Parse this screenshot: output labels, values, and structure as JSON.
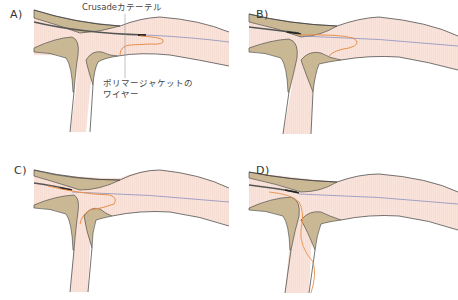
{
  "figure": {
    "panels": [
      {
        "id": "A",
        "label": "A)"
      },
      {
        "id": "B",
        "label": "B)"
      },
      {
        "id": "C",
        "label": "C)"
      },
      {
        "id": "D",
        "label": "D)"
      }
    ],
    "annotations": {
      "catheter": "Crusadeカテーテル",
      "wire_line1": "ポリマージャケットの",
      "wire_line2": "ワイヤー"
    },
    "colors": {
      "vessel_lumen": "#f9e3da",
      "plaque": "#c9b893",
      "vessel_wall": "#3a3a3a",
      "guidewire": "#8a8fbf",
      "polymer_wire": "#e8904a",
      "catheter": "#555555"
    }
  }
}
